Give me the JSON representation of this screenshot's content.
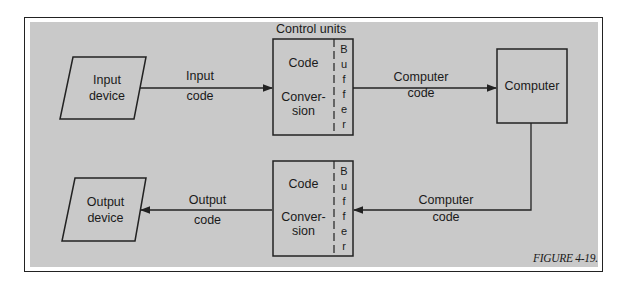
{
  "figure": {
    "caption": "FIGURE 4-19.",
    "control_units_label": "Control units"
  },
  "nodes": {
    "input_device": {
      "line1": "Input",
      "line2": "device"
    },
    "output_device": {
      "line1": "Output",
      "line2": "device"
    },
    "computer": {
      "label": "Computer"
    },
    "control_unit_top": {
      "code": "Code",
      "conv1": "Conver-",
      "conv2": "sion",
      "buffer": [
        "B",
        "u",
        "f",
        "f",
        "e",
        "r"
      ]
    },
    "control_unit_bottom": {
      "code": "Code",
      "conv1": "Conver-",
      "conv2": "sion",
      "buffer": [
        "B",
        "u",
        "f",
        "f",
        "e",
        "r"
      ]
    }
  },
  "edges": {
    "input_code": {
      "line1": "Input",
      "line2": "code"
    },
    "computer_code_out": {
      "line1": "Computer",
      "line2": "code"
    },
    "computer_code_in": {
      "line1": "Computer",
      "line2": "code"
    },
    "output_code": {
      "line1": "Output",
      "line2": "code"
    }
  },
  "colors": {
    "panel": "#c9c9c9",
    "stroke": "#222222"
  }
}
